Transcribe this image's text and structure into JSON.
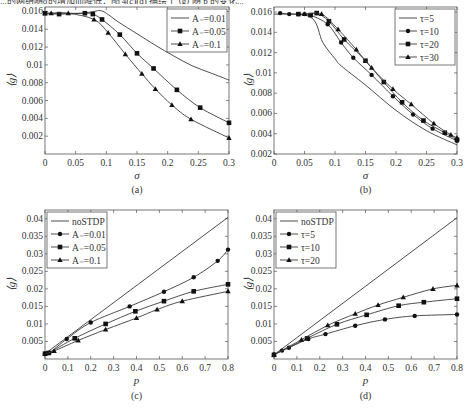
{
  "top_text": "...的网络随σ的增加而降低；图 4(c)(d) 描绘了 ⟨g⟩ 随 p 的变化...",
  "chart_data": [
    {
      "id": "a",
      "type": "line",
      "panel_label": "(a)",
      "xlabel": "σ",
      "ylabel": "⟨g⟩",
      "xlim": [
        0,
        0.3
      ],
      "ylim": [
        0,
        0.0165
      ],
      "xticks": [
        0,
        0.05,
        0.1,
        0.15,
        0.2,
        0.25,
        0.3
      ],
      "xtick_labels": [
        "0",
        "0.05",
        "0.1",
        "0.15",
        "0.2",
        "0.25",
        "0.3"
      ],
      "yticks": [
        0.002,
        0.004,
        0.006,
        0.008,
        0.01,
        0.012,
        0.014,
        0.016
      ],
      "ytick_labels": [
        "0.002",
        "0.004",
        "0.006",
        "0.008",
        "0.01",
        "0.012",
        "0.014",
        "0.016"
      ],
      "legend_position": "upper right",
      "grid": false,
      "series": [
        {
          "name": "A₋=0.01",
          "marker": "none",
          "x": [
            0,
            0.02,
            0.04,
            0.06,
            0.08,
            0.09,
            0.1,
            0.12,
            0.15,
            0.18,
            0.21,
            0.24,
            0.27,
            0.3
          ],
          "y": [
            0.0158,
            0.0158,
            0.0158,
            0.0158,
            0.016,
            0.0161,
            0.0158,
            0.0148,
            0.0135,
            0.0122,
            0.011,
            0.0099,
            0.0091,
            0.0083
          ]
        },
        {
          "name": "A₋=0.05",
          "marker": "square",
          "x": [
            0,
            0.023,
            0.065,
            0.078,
            0.093,
            0.122,
            0.15,
            0.177,
            0.215,
            0.253,
            0.3
          ],
          "y": [
            0.0158,
            0.0157,
            0.0158,
            0.0157,
            0.0151,
            0.0134,
            0.0113,
            0.0096,
            0.0072,
            0.0052,
            0.0035
          ]
        },
        {
          "name": "A₋=0.1",
          "marker": "triangle",
          "x": [
            0,
            0.01,
            0.038,
            0.08,
            0.103,
            0.131,
            0.158,
            0.18,
            0.207,
            0.238,
            0.3
          ],
          "y": [
            0.0158,
            0.0158,
            0.0158,
            0.0151,
            0.0136,
            0.0112,
            0.009,
            0.0073,
            0.0055,
            0.0039,
            0.0018
          ]
        }
      ]
    },
    {
      "id": "b",
      "type": "line",
      "panel_label": "(b)",
      "xlabel": "σ",
      "ylabel": "⟨g⟩",
      "xlim": [
        0,
        0.3
      ],
      "ylim": [
        0.002,
        0.0165
      ],
      "xticks": [
        0,
        0.05,
        0.1,
        0.15,
        0.2,
        0.25,
        0.3
      ],
      "xtick_labels": [
        "0",
        "0.05",
        "0.1",
        "0.15",
        "0.2",
        "0.25",
        "0.3"
      ],
      "yticks": [
        0.002,
        0.004,
        0.006,
        0.008,
        0.01,
        0.012,
        0.014,
        0.016
      ],
      "ytick_labels": [
        "0.002",
        "0.004",
        "0.006",
        "0.008",
        "0.01",
        "0.012",
        "0.014",
        "0.016"
      ],
      "legend_position": "upper right",
      "grid": false,
      "series": [
        {
          "name": "τ=5",
          "marker": "none",
          "x": [
            0,
            0.06,
            0.08,
            0.1,
            0.11,
            0.15,
            0.2,
            0.25,
            0.3
          ],
          "y": [
            0.0158,
            0.0155,
            0.013,
            0.0114,
            0.0107,
            0.0088,
            0.0063,
            0.0043,
            0.0029
          ]
        },
        {
          "name": "τ=10",
          "marker": "circle",
          "x": [
            0.01,
            0.025,
            0.04,
            0.05,
            0.06,
            0.088,
            0.11,
            0.13,
            0.16,
            0.195,
            0.228,
            0.26,
            0.3
          ],
          "y": [
            0.0159,
            0.0158,
            0.0158,
            0.0158,
            0.0157,
            0.0148,
            0.013,
            0.0115,
            0.0098,
            0.0077,
            0.0059,
            0.0045,
            0.0033
          ]
        },
        {
          "name": "τ=20",
          "marker": "square",
          "x": [
            0.04,
            0.06,
            0.07,
            0.09,
            0.115,
            0.15,
            0.18,
            0.21,
            0.245,
            0.28,
            0.3
          ],
          "y": [
            0.0158,
            0.0157,
            0.0159,
            0.0151,
            0.0133,
            0.0112,
            0.0091,
            0.0071,
            0.0053,
            0.0041,
            0.0034
          ]
        },
        {
          "name": "τ=30",
          "marker": "triangle",
          "x": [
            0.05,
            0.078,
            0.105,
            0.135,
            0.16,
            0.195,
            0.225,
            0.262,
            0.29,
            0.3
          ],
          "y": [
            0.0158,
            0.0158,
            0.0143,
            0.0123,
            0.0105,
            0.0084,
            0.0069,
            0.005,
            0.0039,
            0.0036
          ]
        }
      ]
    },
    {
      "id": "c",
      "type": "line",
      "panel_label": "(c)",
      "xlabel": "p",
      "ylabel": "⟨g⟩",
      "xlim": [
        0,
        0.8
      ],
      "ylim": [
        0,
        0.0425
      ],
      "xticks": [
        0,
        0.1,
        0.2,
        0.3,
        0.4,
        0.5,
        0.6,
        0.7,
        0.8
      ],
      "xtick_labels": [
        "0",
        "0.1",
        "0.2",
        "0.3",
        "0.4",
        "0.5",
        "0.6",
        "0.7",
        "0.8"
      ],
      "yticks": [
        0.005,
        0.01,
        0.015,
        0.02,
        0.025,
        0.03,
        0.035,
        0.04
      ],
      "ytick_labels": [
        "0.005",
        "0.01",
        "0.015",
        "0.02",
        "0.025",
        "0.03",
        "0.035",
        "0.04"
      ],
      "legend_position": "upper left",
      "grid": false,
      "series": [
        {
          "name": "noSTDP",
          "marker": "none",
          "x": [
            0,
            0.8
          ],
          "y": [
            0.0015,
            0.0404
          ]
        },
        {
          "name": "A₋=0.01",
          "marker": "circle",
          "x": [
            0,
            0.02,
            0.095,
            0.2,
            0.37,
            0.52,
            0.65,
            0.755,
            0.8
          ],
          "y": [
            0.0015,
            0.0018,
            0.0057,
            0.0104,
            0.015,
            0.0192,
            0.0233,
            0.028,
            0.0312
          ]
        },
        {
          "name": "A₋=0.05",
          "marker": "square",
          "x": [
            0,
            0.015,
            0.13,
            0.265,
            0.395,
            0.52,
            0.65,
            0.8
          ],
          "y": [
            0.0015,
            0.0017,
            0.0059,
            0.01,
            0.0136,
            0.0165,
            0.0193,
            0.0213
          ]
        },
        {
          "name": "A₋=0.1",
          "marker": "triangle",
          "x": [
            0,
            0.04,
            0.145,
            0.265,
            0.4,
            0.49,
            0.6,
            0.8
          ],
          "y": [
            0.0015,
            0.0023,
            0.0053,
            0.0084,
            0.0117,
            0.0141,
            0.0165,
            0.0193
          ]
        }
      ]
    },
    {
      "id": "d",
      "type": "line",
      "panel_label": "(d)",
      "xlabel": "p",
      "ylabel": "⟨g⟩",
      "xlim": [
        0,
        0.8
      ],
      "ylim": [
        0,
        0.0425
      ],
      "xticks": [
        0,
        0.1,
        0.2,
        0.3,
        0.4,
        0.5,
        0.6,
        0.7,
        0.8
      ],
      "xtick_labels": [
        "0",
        "0.1",
        "0.2",
        "0.3",
        "0.4",
        "0.5",
        "0.6",
        "0.7",
        "0.8"
      ],
      "yticks": [
        0.005,
        0.01,
        0.015,
        0.02,
        0.025,
        0.03,
        0.035,
        0.04
      ],
      "ytick_labels": [
        "0.005",
        "0.01",
        "0.015",
        "0.02",
        "0.025",
        "0.03",
        "0.035",
        "0.04"
      ],
      "legend_position": "upper left",
      "grid": false,
      "series": [
        {
          "name": "noSTDP",
          "marker": "none",
          "x": [
            0,
            0.8
          ],
          "y": [
            0.0012,
            0.0403
          ]
        },
        {
          "name": "τ=5",
          "marker": "circle",
          "x": [
            0,
            0.035,
            0.065,
            0.15,
            0.225,
            0.355,
            0.485,
            0.615,
            0.8
          ],
          "y": [
            0.0012,
            0.0024,
            0.0032,
            0.0057,
            0.0071,
            0.0095,
            0.0113,
            0.0123,
            0.0127
          ]
        },
        {
          "name": "τ=10",
          "marker": "square",
          "x": [
            0,
            0.145,
            0.275,
            0.405,
            0.545,
            0.655,
            0.8
          ],
          "y": [
            0.0012,
            0.0059,
            0.0099,
            0.0126,
            0.0152,
            0.0162,
            0.0172
          ]
        },
        {
          "name": "τ=20",
          "marker": "triangle",
          "x": [
            0,
            0.12,
            0.235,
            0.355,
            0.455,
            0.565,
            0.695,
            0.8
          ],
          "y": [
            0.0012,
            0.0055,
            0.0096,
            0.0129,
            0.0154,
            0.0176,
            0.02,
            0.021
          ]
        }
      ]
    }
  ]
}
